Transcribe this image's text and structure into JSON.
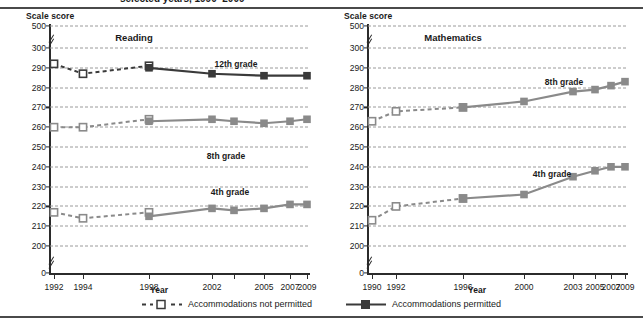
{
  "report": {
    "title_partial": "selected years, 1990–2009"
  },
  "legend": {
    "items": [
      {
        "key": "not-permitted",
        "label": "Accommodations not permitted",
        "style": "dashed-open-square",
        "color": "#3a3a3a"
      },
      {
        "key": "permitted",
        "label": "Accommodations permitted",
        "style": "solid-filled-square",
        "color": "#3a3a3a"
      }
    ]
  },
  "colors": {
    "grade12": "#3a3a3a",
    "grade8": "#8a8a8a",
    "grade4": "#8a8a8a",
    "axis": "#2b2b2b",
    "grid": "#9a9a9a"
  },
  "panels": [
    {
      "id": "reading",
      "title": "Reading",
      "y_axis_label": "Scale score",
      "x_axis_label": "Year",
      "y_ticks": [
        "500",
        "300",
        "290",
        "280",
        "270",
        "260",
        "250",
        "240",
        "230",
        "220",
        "210",
        "200",
        "0"
      ],
      "x_ticks": [
        "1992",
        "1994",
        "1998",
        "2002",
        "2005",
        "2007",
        "2009"
      ],
      "series_labels": [
        "12th grade",
        "8th grade",
        "4th grade"
      ]
    },
    {
      "id": "mathematics",
      "title": "Mathematics",
      "y_axis_label": "Scale score",
      "x_axis_label": "Year",
      "y_ticks": [
        "500",
        "300",
        "290",
        "280",
        "270",
        "260",
        "250",
        "240",
        "230",
        "220",
        "210",
        "200",
        "0"
      ],
      "x_ticks": [
        "1990",
        "1992",
        "1996",
        "2000",
        "2003",
        "2005",
        "2007",
        "2009"
      ],
      "series_labels": [
        "8th grade",
        "4th grade"
      ]
    }
  ],
  "chart_data": [
    {
      "type": "line",
      "title": "Reading",
      "xlabel": "Year",
      "ylabel": "Scale score",
      "ylim": [
        200,
        300
      ],
      "y_ticks": [
        200,
        210,
        220,
        230,
        240,
        250,
        260,
        270,
        280,
        290,
        300
      ],
      "y_axis_break": [
        "between 0 and 200",
        "between 300 and 500"
      ],
      "grid": true,
      "legend_position": "below-figure",
      "x": [
        1992,
        1994,
        1998,
        2002,
        2003,
        2005,
        2007,
        2009
      ],
      "x_tick_labels": [
        "1992",
        "1994",
        "1998",
        "2002",
        "2005",
        "2007",
        "2009"
      ],
      "series": [
        {
          "name": "12th grade — accommodations not permitted",
          "grade": "12th grade",
          "accommodations": "not permitted",
          "style": "dashed",
          "marker": "open-square",
          "x": [
            1992,
            1994,
            1998
          ],
          "values": [
            292,
            287,
            291
          ]
        },
        {
          "name": "12th grade — accommodations permitted",
          "grade": "12th grade",
          "accommodations": "permitted",
          "style": "solid",
          "marker": "filled-square",
          "x": [
            1998,
            2002,
            2005,
            2009
          ],
          "values": [
            290,
            287,
            286,
            286
          ]
        },
        {
          "name": "8th grade — accommodations not permitted",
          "grade": "8th grade",
          "accommodations": "not permitted",
          "style": "dashed",
          "marker": "open-square",
          "x": [
            1992,
            1994,
            1998
          ],
          "values": [
            260,
            260,
            264
          ]
        },
        {
          "name": "8th grade — accommodations permitted",
          "grade": "8th grade",
          "accommodations": "permitted",
          "style": "solid",
          "marker": "filled-square",
          "x": [
            1998,
            2002,
            2003,
            2005,
            2007,
            2009
          ],
          "values": [
            263,
            264,
            263,
            262,
            263,
            264
          ]
        },
        {
          "name": "4th grade — accommodations not permitted",
          "grade": "4th grade",
          "accommodations": "not permitted",
          "style": "dashed",
          "marker": "open-square",
          "x": [
            1992,
            1994,
            1998
          ],
          "values": [
            217,
            214,
            217
          ]
        },
        {
          "name": "4th grade — accommodations permitted",
          "grade": "4th grade",
          "accommodations": "permitted",
          "style": "solid",
          "marker": "filled-square",
          "x": [
            1998,
            2002,
            2003,
            2005,
            2007,
            2009
          ],
          "values": [
            215,
            219,
            218,
            219,
            221,
            221
          ]
        }
      ],
      "annotations": [
        "12th grade",
        "8th grade",
        "4th grade"
      ]
    },
    {
      "type": "line",
      "title": "Mathematics",
      "xlabel": "Year",
      "ylabel": "Scale score",
      "ylim": [
        200,
        300
      ],
      "y_ticks": [
        200,
        210,
        220,
        230,
        240,
        250,
        260,
        270,
        280,
        290,
        300
      ],
      "y_axis_break": [
        "between 0 and 200",
        "between 300 and 500"
      ],
      "grid": true,
      "legend_position": "below-figure",
      "x": [
        1990,
        1992,
        1996,
        2000,
        2003,
        2005,
        2007,
        2009
      ],
      "x_tick_labels": [
        "1990",
        "1992",
        "1996",
        "2000",
        "2003",
        "2005",
        "2007",
        "2009"
      ],
      "series": [
        {
          "name": "8th grade — accommodations not permitted",
          "grade": "8th grade",
          "accommodations": "not permitted",
          "style": "dashed",
          "marker": "open-square",
          "x": [
            1990,
            1992,
            1996
          ],
          "values": [
            263,
            268,
            270
          ]
        },
        {
          "name": "8th grade — accommodations permitted",
          "grade": "8th grade",
          "accommodations": "permitted",
          "style": "solid",
          "marker": "filled-square",
          "x": [
            1996,
            2000,
            2003,
            2005,
            2007,
            2009
          ],
          "values": [
            270,
            273,
            278,
            279,
            281,
            283
          ]
        },
        {
          "name": "4th grade — accommodations not permitted",
          "grade": "4th grade",
          "accommodations": "not permitted",
          "style": "dashed",
          "marker": "open-square",
          "x": [
            1990,
            1992,
            1996
          ],
          "values": [
            213,
            220,
            224
          ]
        },
        {
          "name": "4th grade — accommodations permitted",
          "grade": "4th grade",
          "accommodations": "permitted",
          "style": "solid",
          "marker": "filled-square",
          "x": [
            1996,
            2000,
            2003,
            2005,
            2007,
            2009
          ],
          "values": [
            224,
            226,
            235,
            238,
            240,
            240
          ]
        }
      ],
      "annotations": [
        "8th grade",
        "4th grade"
      ]
    }
  ]
}
